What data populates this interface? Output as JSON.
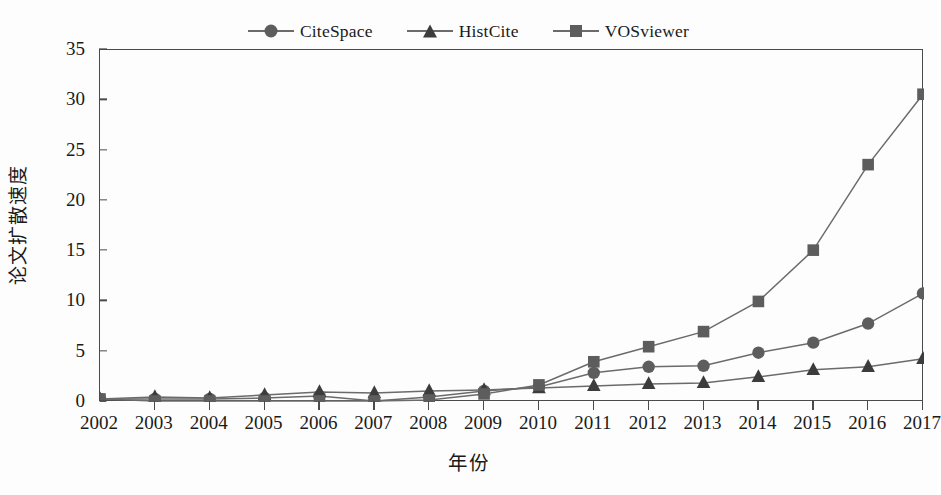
{
  "chart_data": {
    "type": "line",
    "title": "",
    "xlabel": "年份",
    "ylabel": "论文扩散速度",
    "x": [
      2002,
      2003,
      2004,
      2005,
      2006,
      2007,
      2008,
      2009,
      2010,
      2011,
      2012,
      2013,
      2014,
      2015,
      2016,
      2017
    ],
    "categories": [
      "2002",
      "2003",
      "2004",
      "2005",
      "2006",
      "2007",
      "2008",
      "2009",
      "2010",
      "2011",
      "2012",
      "2013",
      "2014",
      "2015",
      "2016",
      "2017"
    ],
    "xlim": [
      2002,
      2017
    ],
    "ylim": [
      0,
      35
    ],
    "yticks": [
      0,
      5,
      10,
      15,
      20,
      25,
      30,
      35
    ],
    "ytick_labels": [
      "0",
      "5",
      "10",
      "15",
      "20",
      "25",
      "30",
      "35"
    ],
    "grid": false,
    "legend_position": "top-center",
    "series": [
      {
        "name": "CiteSpace",
        "marker": "circle",
        "color": "#5d5d5d",
        "values": [
          0.3,
          0.3,
          0.3,
          0.4,
          0.6,
          0.1,
          0.5,
          1.1,
          1.5,
          2.9,
          3.5,
          3.6,
          4.9,
          5.9,
          7.8,
          10.8
        ]
      },
      {
        "name": "HistCite",
        "marker": "triangle",
        "color": "#3c3c3c",
        "values": [
          0.3,
          0.5,
          0.4,
          0.7,
          1.0,
          0.9,
          1.1,
          1.2,
          1.4,
          1.6,
          1.8,
          1.9,
          2.5,
          3.2,
          3.5,
          4.3
        ]
      },
      {
        "name": "VOSviewer",
        "marker": "square",
        "color": "#5d5d5d",
        "values": [
          0.3,
          0.1,
          0.1,
          0.1,
          0.1,
          0.1,
          0.2,
          0.8,
          1.7,
          4.0,
          5.5,
          7.0,
          10.0,
          15.1,
          23.6,
          30.6
        ]
      }
    ]
  },
  "legend": {
    "items": [
      {
        "label": "CiteSpace",
        "marker": "circle"
      },
      {
        "label": "HistCite",
        "marker": "triangle"
      },
      {
        "label": "VOSviewer",
        "marker": "square"
      }
    ]
  },
  "axes": {
    "x_title": "年份",
    "y_title": "论文扩散速度"
  },
  "colors": {
    "line": "#6b6b6b",
    "marker_circle": "#5d5d5d",
    "marker_triangle": "#3c3c3c",
    "marker_square": "#5d5d5d",
    "axis": "#4a4a4a",
    "background": "#fdfdfd"
  }
}
